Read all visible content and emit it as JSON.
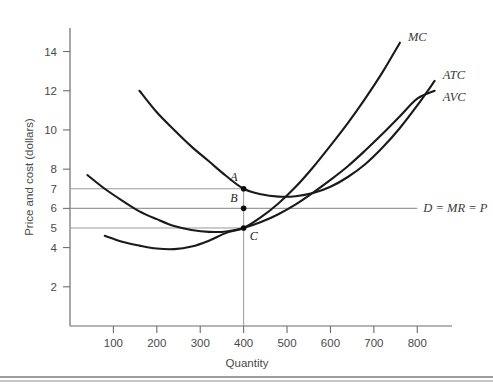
{
  "figure": {
    "background_color": "#ffffff",
    "curve_color": "#1a1a1a",
    "guide_color": "#9a9a9a",
    "axis_color": "#6d6d6d"
  },
  "chart_data": {
    "type": "line",
    "title": "",
    "xlabel": "Quantity",
    "ylabel": "Price and cost (dollars)",
    "xlim": [
      0,
      880
    ],
    "ylim": [
      0,
      15.2
    ],
    "grid": false,
    "legend_position": "inline-curve-labels",
    "xticks": [
      100,
      200,
      300,
      400,
      500,
      600,
      700,
      800
    ],
    "yticks": [
      2,
      4,
      6,
      8,
      10,
      12,
      14
    ],
    "y_guide_values": [
      5,
      6,
      7
    ],
    "y_guide_labels": [
      "5",
      "6",
      "7"
    ],
    "series": [
      {
        "name": "MC",
        "label": "MC",
        "points": [
          [
            80,
            4.6
          ],
          [
            120,
            4.3
          ],
          [
            160,
            4.1
          ],
          [
            200,
            3.95
          ],
          [
            240,
            3.92
          ],
          [
            280,
            4.05
          ],
          [
            320,
            4.35
          ],
          [
            360,
            4.75
          ],
          [
            400,
            5.0
          ],
          [
            440,
            5.55
          ],
          [
            480,
            6.25
          ],
          [
            520,
            7.1
          ],
          [
            560,
            8.1
          ],
          [
            600,
            9.2
          ],
          [
            640,
            10.35
          ],
          [
            680,
            11.6
          ],
          [
            720,
            12.95
          ],
          [
            760,
            14.45
          ]
        ]
      },
      {
        "name": "ATC",
        "label": "ATC",
        "points": [
          [
            160,
            12.0
          ],
          [
            200,
            10.9
          ],
          [
            240,
            10.0
          ],
          [
            280,
            9.15
          ],
          [
            320,
            8.4
          ],
          [
            360,
            7.65
          ],
          [
            400,
            7.0
          ],
          [
            440,
            6.72
          ],
          [
            480,
            6.6
          ],
          [
            520,
            6.62
          ],
          [
            560,
            6.78
          ],
          [
            600,
            7.1
          ],
          [
            640,
            7.6
          ],
          [
            680,
            8.25
          ],
          [
            720,
            9.1
          ],
          [
            760,
            10.1
          ],
          [
            800,
            11.25
          ],
          [
            840,
            12.5
          ]
        ]
      },
      {
        "name": "AVC",
        "label": "AVC",
        "points": [
          [
            40,
            7.7
          ],
          [
            80,
            7.0
          ],
          [
            120,
            6.4
          ],
          [
            160,
            5.85
          ],
          [
            200,
            5.45
          ],
          [
            240,
            5.1
          ],
          [
            280,
            4.9
          ],
          [
            320,
            4.8
          ],
          [
            360,
            4.82
          ],
          [
            400,
            5.0
          ],
          [
            440,
            5.3
          ],
          [
            480,
            5.7
          ],
          [
            520,
            6.2
          ],
          [
            560,
            6.8
          ],
          [
            600,
            7.45
          ],
          [
            640,
            8.15
          ],
          [
            680,
            8.95
          ],
          [
            720,
            9.8
          ],
          [
            760,
            10.7
          ],
          [
            800,
            11.6
          ],
          [
            840,
            12.0
          ]
        ]
      },
      {
        "name": "Demand",
        "label": "D = MR = P",
        "type": "horizontal",
        "value": 6,
        "x_start": 0,
        "x_end": 800
      }
    ],
    "annotations": [
      {
        "label": "A",
        "x": 400,
        "y": 7,
        "curve": "ATC"
      },
      {
        "label": "B",
        "x": 400,
        "y": 6,
        "curve": "MC"
      },
      {
        "label": "C",
        "x": 400,
        "y": 5,
        "curve": "AVC"
      }
    ],
    "dropline": {
      "x": 400,
      "from_y": 7,
      "to_y": 0
    }
  }
}
